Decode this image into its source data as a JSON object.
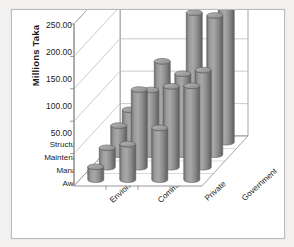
{
  "chart_data": {
    "type": "bar",
    "title": "",
    "subtitle": "",
    "xlabel": "",
    "ylabel": "Millions Taka",
    "ylim": [
      0,
      250
    ],
    "ytick_labels": [
      "250.00",
      "200.00",
      "150.00",
      "100.00",
      "50.00"
    ],
    "ytick_values": [
      250,
      200,
      150,
      100,
      50
    ],
    "grid": true,
    "legend_position": "depth-axis",
    "three_d": true,
    "categories": [
      "Enviornment",
      "Community",
      "Private",
      "Government"
    ],
    "series": [
      {
        "name": "Structural",
        "values": [
          50,
          125,
          200,
          225
        ]
      },
      {
        "name": "Maintenance",
        "values": [
          45,
          100,
          125,
          215
        ]
      },
      {
        "name": "Managerial",
        "values": [
          30,
          120,
          125,
          150
        ]
      },
      {
        "name": "Awareness",
        "values": [
          20,
          55,
          80,
          145
        ]
      }
    ],
    "colors": {
      "bar_fill": "#8e8e8e",
      "bar_edge": "#5c5c5c",
      "bar_top": "#a9a9a9",
      "gridline": "#b5b5b5",
      "axis": "#808080",
      "text": "#1b1b1b",
      "plot_background": "#ffffff"
    }
  },
  "axes": {
    "y_title": "Millions Taka",
    "y_ticks": [
      "250.00",
      "200.00",
      "150.00",
      "100.00",
      "50.00"
    ],
    "z_labels": [
      "Structural",
      "Maintenance",
      "Managerial",
      "Awareness"
    ],
    "x_labels": [
      "Enviornment",
      "Community",
      "Private",
      "Government"
    ]
  }
}
